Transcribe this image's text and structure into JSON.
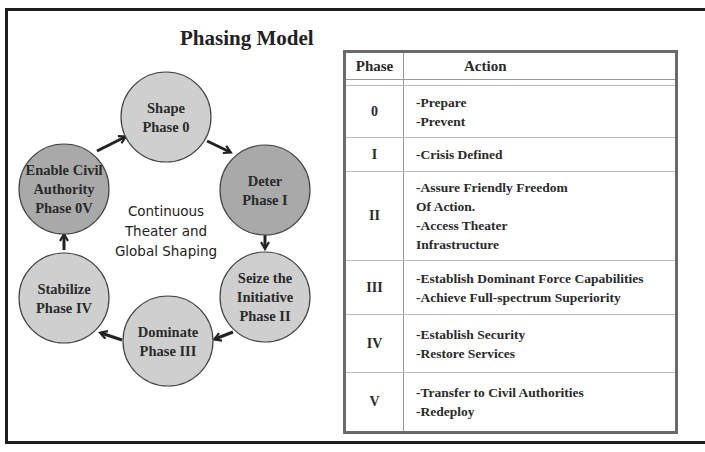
{
  "title": "Phasing Model",
  "cycle": {
    "center_label": [
      "Continuous",
      "Theater and",
      "Global Shaping"
    ],
    "nodes": [
      {
        "id": "shape",
        "lines": [
          "Shape",
          "Phase 0"
        ],
        "shade": "light"
      },
      {
        "id": "deter",
        "lines": [
          "Deter",
          "Phase I"
        ],
        "shade": "dark"
      },
      {
        "id": "seize",
        "lines": [
          "Seize the",
          "Initiative",
          "Phase II"
        ],
        "shade": "light"
      },
      {
        "id": "dominate",
        "lines": [
          "Dominate",
          "Phase III"
        ],
        "shade": "light"
      },
      {
        "id": "stabilize",
        "lines": [
          "Stabilize",
          "Phase IV"
        ],
        "shade": "light"
      },
      {
        "id": "enable",
        "lines": [
          "Enable Civil",
          "Authority",
          "Phase 0V"
        ],
        "shade": "dark"
      }
    ],
    "colors": {
      "light": "#cfcfcf",
      "dark": "#a9a9a9",
      "stroke": "#444444"
    }
  },
  "table": {
    "headers": {
      "phase": "Phase",
      "action": "Action"
    },
    "rows": [
      {
        "phase": "0",
        "actions": [
          "-Prepare",
          "-Prevent"
        ]
      },
      {
        "phase": "I",
        "actions": [
          "-Crisis Defined"
        ]
      },
      {
        "phase": "II",
        "actions": [
          "-Assure Friendly Freedom",
          "Of Action.",
          "-Access Theater",
          "Infrastructure"
        ]
      },
      {
        "phase": "III",
        "actions": [
          "-Establish Dominant Force Capabilities",
          "-Achieve Full-spectrum Superiority"
        ]
      },
      {
        "phase": "IV",
        "actions": [
          "-Establish Security",
          "-Restore Services"
        ]
      },
      {
        "phase": "V",
        "actions": [
          "-Transfer to Civil Authorities",
          "-Redeploy"
        ]
      }
    ]
  }
}
